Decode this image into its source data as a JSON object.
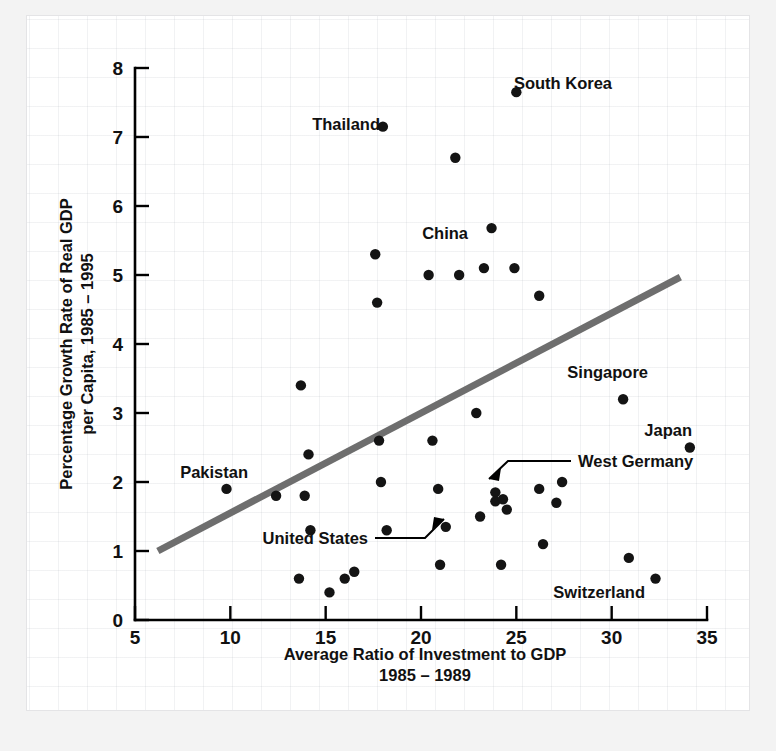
{
  "chart_data": {
    "type": "scatter",
    "title": "",
    "xlabel": "Average Ratio of Investment to GDP",
    "xlabel_line2": "1985 – 1989",
    "ylabel": "Percentage Growth Rate of Real GDP",
    "ylabel_line2": "per Capita, 1985 – 1995",
    "xlim": [
      5,
      35
    ],
    "ylim": [
      0,
      8
    ],
    "xticks": [
      5,
      10,
      15,
      20,
      25,
      30,
      35
    ],
    "xtick_labels": [
      "5",
      "10",
      "15",
      "20",
      "25",
      "30",
      "35"
    ],
    "yticks": [
      0,
      1,
      2,
      3,
      4,
      5,
      6,
      7,
      8
    ],
    "ytick_labels": [
      "0",
      "1",
      "2",
      "3",
      "4",
      "5",
      "6",
      "7",
      "8"
    ],
    "grid": true,
    "grid_style": "faint graph paper background",
    "legend": "none",
    "marker": "filled circle",
    "marker_color": "#141414",
    "trendline": {
      "visible": true,
      "color": "#6e6e6e",
      "width": 7,
      "x_start": 6.2,
      "y_start": 1.0,
      "x_end": 33.6,
      "y_end": 4.97
    },
    "points": [
      {
        "x": 9.8,
        "y": 1.9,
        "label": "Pakistan"
      },
      {
        "x": 12.4,
        "y": 1.8,
        "label": ""
      },
      {
        "x": 13.6,
        "y": 0.6,
        "label": ""
      },
      {
        "x": 13.7,
        "y": 3.4,
        "label": ""
      },
      {
        "x": 13.9,
        "y": 1.8,
        "label": ""
      },
      {
        "x": 14.1,
        "y": 2.4,
        "label": ""
      },
      {
        "x": 14.2,
        "y": 1.3,
        "label": ""
      },
      {
        "x": 15.2,
        "y": 0.4,
        "label": ""
      },
      {
        "x": 16.0,
        "y": 0.6,
        "label": ""
      },
      {
        "x": 16.5,
        "y": 0.7,
        "label": ""
      },
      {
        "x": 17.6,
        "y": 5.3,
        "label": ""
      },
      {
        "x": 17.7,
        "y": 4.6,
        "label": ""
      },
      {
        "x": 17.8,
        "y": 2.6,
        "label": ""
      },
      {
        "x": 17.9,
        "y": 2.0,
        "label": ""
      },
      {
        "x": 18.0,
        "y": 7.15,
        "label": "Thailand"
      },
      {
        "x": 18.2,
        "y": 1.3,
        "label": ""
      },
      {
        "x": 20.4,
        "y": 5.0,
        "label": ""
      },
      {
        "x": 20.6,
        "y": 2.6,
        "label": ""
      },
      {
        "x": 20.9,
        "y": 1.9,
        "label": ""
      },
      {
        "x": 21.3,
        "y": 1.35,
        "label": "United States"
      },
      {
        "x": 21.0,
        "y": 0.8,
        "label": ""
      },
      {
        "x": 21.8,
        "y": 6.7,
        "label": ""
      },
      {
        "x": 22.0,
        "y": 5.0,
        "label": ""
      },
      {
        "x": 22.9,
        "y": 3.0,
        "label": ""
      },
      {
        "x": 23.1,
        "y": 1.5,
        "label": ""
      },
      {
        "x": 23.3,
        "y": 5.1,
        "label": ""
      },
      {
        "x": 23.7,
        "y": 5.68,
        "label": "China"
      },
      {
        "x": 23.9,
        "y": 1.85,
        "label": "West Germany"
      },
      {
        "x": 23.9,
        "y": 1.72,
        "label": ""
      },
      {
        "x": 24.3,
        "y": 1.75,
        "label": ""
      },
      {
        "x": 24.5,
        "y": 1.6,
        "label": ""
      },
      {
        "x": 24.2,
        "y": 0.8,
        "label": ""
      },
      {
        "x": 24.9,
        "y": 5.1,
        "label": ""
      },
      {
        "x": 25.0,
        "y": 7.65,
        "label": "South Korea"
      },
      {
        "x": 26.2,
        "y": 4.7,
        "label": ""
      },
      {
        "x": 26.2,
        "y": 1.9,
        "label": ""
      },
      {
        "x": 26.4,
        "y": 1.1,
        "label": ""
      },
      {
        "x": 27.1,
        "y": 1.7,
        "label": ""
      },
      {
        "x": 27.4,
        "y": 2.0,
        "label": ""
      },
      {
        "x": 30.6,
        "y": 3.2,
        "label": "Singapore"
      },
      {
        "x": 30.9,
        "y": 0.9,
        "label": ""
      },
      {
        "x": 32.3,
        "y": 0.6,
        "label": "Switzerland"
      },
      {
        "x": 34.1,
        "y": 2.5,
        "label": "Japan"
      }
    ],
    "annotations": [
      {
        "text": "South Korea",
        "anchor_x": 25.0,
        "anchor_y": 7.65,
        "placement": "left-of-point"
      },
      {
        "text": "Thailand",
        "anchor_x": 18.0,
        "anchor_y": 7.15,
        "placement": "left-of-point"
      },
      {
        "text": "China",
        "anchor_x": 23.7,
        "anchor_y": 5.68,
        "placement": "left-of-point"
      },
      {
        "text": "Singapore",
        "anchor_x": 30.6,
        "anchor_y": 3.2,
        "placement": "left-of-point"
      },
      {
        "text": "Japan",
        "anchor_x": 34.1,
        "anchor_y": 2.5,
        "placement": "above-point"
      },
      {
        "text": "West Germany",
        "anchor_x": 23.9,
        "anchor_y": 1.85,
        "placement": "leader-line-right"
      },
      {
        "text": "Pakistan",
        "anchor_x": 9.8,
        "anchor_y": 1.9,
        "placement": "above-point"
      },
      {
        "text": "United States",
        "anchor_x": 21.3,
        "anchor_y": 1.35,
        "placement": "leader-line-left"
      },
      {
        "text": "Switzerland",
        "anchor_x": 32.3,
        "anchor_y": 0.6,
        "placement": "left-of-point"
      }
    ]
  },
  "labels": {
    "south_korea": "South Korea",
    "thailand": "Thailand",
    "china": "China",
    "singapore": "Singapore",
    "japan": "Japan",
    "west_germany": "West Germany",
    "pakistan": "Pakistan",
    "united_states": "United States",
    "switzerland": "Switzerland"
  },
  "axes": {
    "x_title_line1": "Average Ratio of Investment to GDP",
    "x_title_line2": "1985 – 1989",
    "y_title_line1": "Percentage Growth Rate of Real GDP",
    "y_title_line2": "per Capita, 1985 – 1995",
    "x_ticks": [
      "5",
      "10",
      "15",
      "20",
      "25",
      "30",
      "35"
    ],
    "y_ticks": [
      "0",
      "1",
      "2",
      "3",
      "4",
      "5",
      "6",
      "7",
      "8"
    ]
  },
  "colors": {
    "marker": "#141414",
    "trendline": "#6e6e6e",
    "axis": "#000000",
    "card_background": "#ffffff",
    "page_background": "#f3f3f3",
    "grid": "#aaafb9"
  }
}
